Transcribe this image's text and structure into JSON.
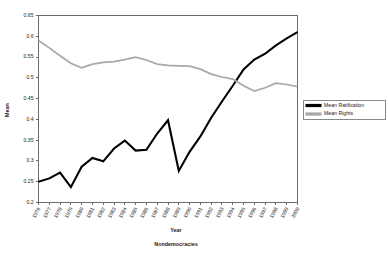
{
  "chart_data": {
    "type": "line",
    "title": "",
    "xlabel": "Year",
    "sublabel": "Nondemocracies",
    "ylabel": "Mean",
    "ylim": [
      0.2,
      0.65
    ],
    "ytick_labels": [
      "0.65",
      "0.6",
      "0.55",
      "0.5",
      "0.45",
      "0.4",
      "0.35",
      "0.3",
      "0.25",
      "0.2"
    ],
    "ytick_values": [
      0.65,
      0.6,
      0.55,
      0.5,
      0.45,
      0.4,
      0.35,
      0.3,
      0.25,
      0.2
    ],
    "grid": false,
    "legend_position": "right",
    "categories": [
      "1976",
      "1977",
      "1978",
      "1979",
      "1980",
      "1981",
      "1982",
      "1983",
      "1984",
      "1985",
      "1986",
      "1987",
      "1988",
      "1989",
      "1990",
      "1991",
      "1992",
      "1993",
      "1994",
      "1995",
      "1996",
      "1997",
      "1998",
      "1999",
      "2000"
    ],
    "series": [
      {
        "name": "Mean Ratification",
        "color": "#000000",
        "values": [
          0.25,
          0.258,
          0.272,
          0.237,
          0.286,
          0.307,
          0.299,
          0.33,
          0.349,
          0.325,
          0.327,
          0.366,
          0.398,
          0.276,
          0.322,
          0.359,
          0.404,
          0.443,
          0.481,
          0.52,
          0.544,
          0.558,
          0.578,
          0.595,
          0.61
        ]
      },
      {
        "name": "Mean Rights",
        "color": "#a8a8a8",
        "values": [
          0.59,
          0.572,
          0.553,
          0.535,
          0.524,
          0.533,
          0.537,
          0.539,
          0.544,
          0.55,
          0.543,
          0.533,
          0.53,
          0.529,
          0.528,
          0.521,
          0.509,
          0.502,
          0.497,
          0.481,
          0.468,
          0.476,
          0.487,
          0.484,
          0.479
        ]
      }
    ]
  },
  "legend": {
    "items": [
      {
        "label": "Mean Ratification",
        "color": "#000000"
      },
      {
        "label": "Mean Rights",
        "color": "#a8a8a8"
      }
    ]
  }
}
